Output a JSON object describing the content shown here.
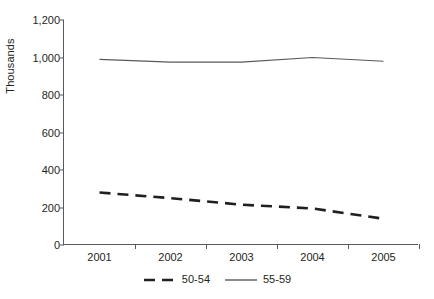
{
  "chart_data": {
    "type": "line",
    "title": "",
    "subtitle": "",
    "xlabel": "",
    "ylabel": "Thousands",
    "categories": [
      "2001",
      "2002",
      "2003",
      "2004",
      "2005"
    ],
    "x": [
      2001,
      2002,
      2003,
      2004,
      2005
    ],
    "series": [
      {
        "name": "50-54",
        "values": [
          280,
          250,
          215,
          195,
          140
        ],
        "style": "dashed",
        "color": "#231f20",
        "width": 2.6
      },
      {
        "name": "55-59",
        "values": [
          990,
          975,
          975,
          1000,
          980
        ],
        "style": "solid",
        "color": "#58595b",
        "width": 1.2
      }
    ],
    "ylim": [
      0,
      1200
    ],
    "yticks": [
      0,
      200,
      400,
      600,
      800,
      1000,
      1200
    ],
    "ytick_labels": [
      "0",
      "200",
      "400",
      "600",
      "800",
      "1,000",
      "1,200"
    ],
    "grid": false,
    "legend_position": "bottom",
    "legend_entries": [
      "50-54",
      "55-59"
    ],
    "axis_color": "#58595b",
    "background": "#ffffff"
  }
}
